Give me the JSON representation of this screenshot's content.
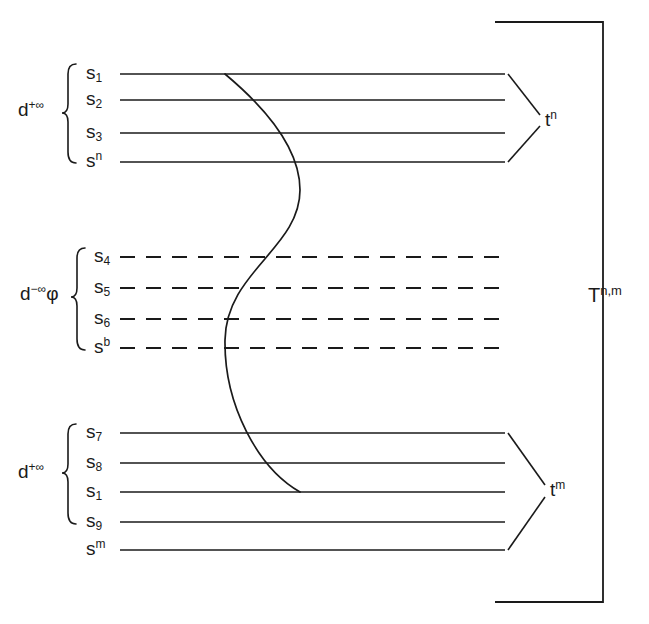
{
  "figure": {
    "ink_color": "#1a1a1a",
    "background": "#ffffff"
  },
  "groups": [
    {
      "id": "top-group",
      "label_base": "d",
      "label_sup": "+∞",
      "label_suffix": "",
      "line_style": "solid",
      "brace_label_full": "d+∞",
      "states": [
        {
          "base": "s",
          "sub": "1",
          "sup": "",
          "y": 74
        },
        {
          "base": "s",
          "sub": "2",
          "sup": "",
          "y": 100
        },
        {
          "base": "s",
          "sub": "3",
          "sup": "",
          "y": 133
        },
        {
          "base": "s",
          "sub": "",
          "sup": "n",
          "y": 162
        }
      ],
      "converge_label_base": "t",
      "converge_label_sup": "n",
      "converge_label_full": "tn",
      "has_converge": true
    },
    {
      "id": "middle-group",
      "label_base": "d",
      "label_sup": "−∞",
      "label_suffix": "φ",
      "line_style": "dashed",
      "brace_label_full": "d−∞φ",
      "states": [
        {
          "base": "s",
          "sub": "4",
          "sup": "",
          "y": 257
        },
        {
          "base": "s",
          "sub": "5",
          "sup": "",
          "y": 288
        },
        {
          "base": "s",
          "sub": "6",
          "sup": "",
          "y": 319
        },
        {
          "base": "s",
          "sub": "",
          "sup": "b",
          "y": 348
        }
      ],
      "converge_label_base": "",
      "converge_label_sup": "",
      "converge_label_full": "",
      "has_converge": false
    },
    {
      "id": "bottom-group",
      "label_base": "d",
      "label_sup": "+∞",
      "label_suffix": "",
      "line_style": "solid",
      "brace_label_full": "d+∞",
      "states": [
        {
          "base": "s",
          "sub": "7",
          "sup": "",
          "y": 433
        },
        {
          "base": "s",
          "sub": "8",
          "sup": "",
          "y": 463
        },
        {
          "base": "s",
          "sub": "1",
          "sup": "",
          "y": 492
        },
        {
          "base": "s",
          "sub": "9",
          "sup": "",
          "y": 522
        },
        {
          "base": "s",
          "sub": "",
          "sup": "m",
          "y": 550
        }
      ],
      "converge_label_base": "t",
      "converge_label_sup": "m",
      "converge_label_full": "tm",
      "has_converge": true
    }
  ],
  "outer_bracket": {
    "label_base": "T",
    "label_mid": ".",
    "label_sup": "n,m",
    "label_full": "T.n,m"
  },
  "trace_curve": {
    "name": "s-curve-trace",
    "start": {
      "x": 225,
      "y": 74
    },
    "end": {
      "x": 300,
      "y": 492
    },
    "description": "S-shaped trace from s1 of top group to s1 of bottom group"
  }
}
